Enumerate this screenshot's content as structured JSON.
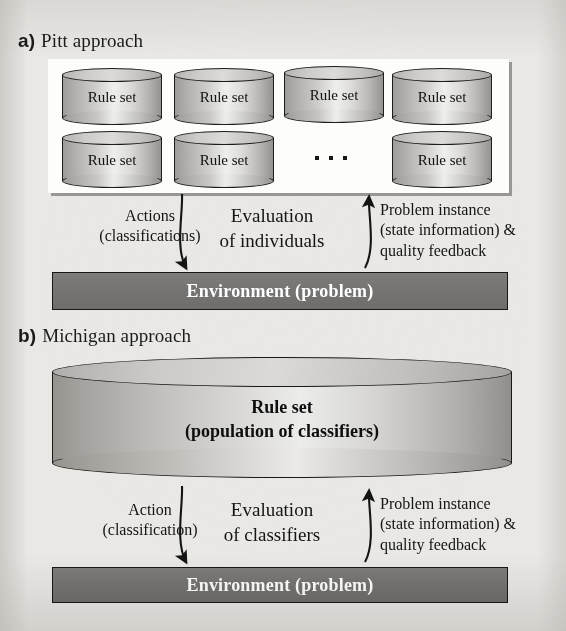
{
  "figure": {
    "background_color": "#e9e8e5",
    "panel_color": "#fdfdfc",
    "environment_bar_color": "#76756f",
    "cylinder_color": "#c9c8c5",
    "ink_color": "#141414"
  },
  "sections": [
    {
      "tag": "a)",
      "title": "Pitt approach",
      "population": {
        "rule_set_label": "Rule set",
        "ellipsis": "· · ·",
        "cylinder_count": 7,
        "row1": [
          "Rule set",
          "Rule set",
          "Rule set",
          "Rule set"
        ],
        "row2": [
          "Rule set",
          "Rule set",
          "Rule set"
        ]
      },
      "flow": {
        "left_line1": "Actions",
        "left_line2": "(classifications)",
        "center_line1": "Evaluation",
        "center_line2": "of individuals",
        "right_line1": "Problem instance",
        "right_line2": "(state information) &",
        "right_line3": "quality feedback"
      },
      "environment_label": "Environment (problem)"
    },
    {
      "tag": "b)",
      "title": "Michigan approach",
      "population": {
        "rule_set_line1": "Rule set",
        "rule_set_line2": "(population of classifiers)"
      },
      "flow": {
        "left_line1": "Action",
        "left_line2": "(classification)",
        "center_line1": "Evaluation",
        "center_line2": "of classifiers",
        "right_line1": "Problem instance",
        "right_line2": "(state information) &",
        "right_line3": "quality feedback"
      },
      "environment_label": "Environment (problem)"
    }
  ]
}
